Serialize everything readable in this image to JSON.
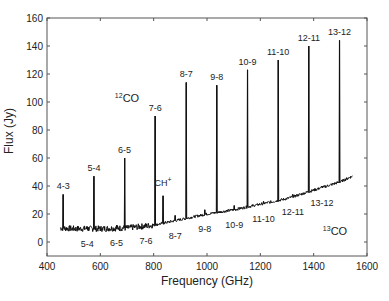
{
  "chart_data": {
    "type": "line",
    "title": "",
    "xlabel": "Frequency (GHz)",
    "ylabel": "Flux (Jy)",
    "xlim": [
      400,
      1600
    ],
    "ylim": [
      -10,
      160
    ],
    "xticks": [
      400,
      600,
      800,
      1000,
      1200,
      1400,
      1600
    ],
    "yticks": [
      0,
      20,
      40,
      60,
      80,
      100,
      120,
      140,
      160
    ],
    "grid": false,
    "legend": null,
    "continuum": {
      "x": [
        450,
        500,
        600,
        700,
        800,
        900,
        1000,
        1100,
        1200,
        1300,
        1400,
        1500,
        1545
      ],
      "y": [
        10,
        9.5,
        9.5,
        10,
        12,
        16,
        20,
        23,
        27,
        31,
        37,
        43,
        47
      ]
    },
    "series": [
      {
        "name": "12CO lines",
        "lines": [
          {
            "label": "4-3",
            "x": 461,
            "peak": 34
          },
          {
            "label": "5-4",
            "x": 576,
            "peak": 47
          },
          {
            "label": "6-5",
            "x": 691,
            "peak": 60
          },
          {
            "label": "7-6",
            "x": 806,
            "peak": 90
          },
          {
            "label": "8-7",
            "x": 922,
            "peak": 114
          },
          {
            "label": "9-8",
            "x": 1037,
            "peak": 112
          },
          {
            "label": "10-9",
            "x": 1152,
            "peak": 123
          },
          {
            "label": "11-10",
            "x": 1267,
            "peak": 130
          },
          {
            "label": "12-11",
            "x": 1382,
            "peak": 140
          },
          {
            "label": "13-12",
            "x": 1497,
            "peak": 144
          }
        ]
      },
      {
        "name": "13CO lines",
        "lines": [
          {
            "label": "5-4",
            "x": 551,
            "peak": 11
          },
          {
            "label": "6-5",
            "x": 661,
            "peak": 12
          },
          {
            "label": "7-6",
            "x": 771,
            "peak": 13
          },
          {
            "label": "8-7",
            "x": 881,
            "peak": 19
          },
          {
            "label": "9-8",
            "x": 992,
            "peak": 23
          },
          {
            "label": "10-9",
            "x": 1102,
            "peak": 26
          },
          {
            "label": "11-10",
            "x": 1212,
            "peak": 29
          },
          {
            "label": "12-11",
            "x": 1322,
            "peak": 34
          },
          {
            "label": "13-12",
            "x": 1431,
            "peak": 40
          }
        ]
      },
      {
        "name": "CH+",
        "lines": [
          {
            "label": "CH+",
            "x": 835,
            "peak": 33
          }
        ]
      }
    ],
    "annotations": [
      {
        "text": "12CO",
        "sup": "12",
        "base": "CO",
        "x": 700,
        "y": 100
      },
      {
        "text": "13CO",
        "sup": "13",
        "base": "CO",
        "x": 1480,
        "y": 5
      },
      {
        "text": "CH+",
        "base": "CH",
        "sup": "+",
        "x": 835,
        "y": 40
      }
    ]
  }
}
